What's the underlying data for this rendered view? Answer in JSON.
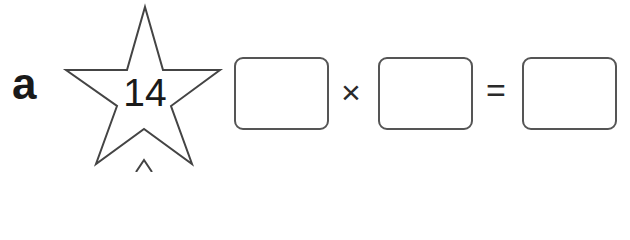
{
  "question": {
    "label": "a",
    "star_number": "14",
    "operators": {
      "multiply": "×",
      "equals": "="
    },
    "answer_boxes": [
      {
        "id": "factor1",
        "value": ""
      },
      {
        "id": "factor2",
        "value": ""
      },
      {
        "id": "product",
        "value": ""
      }
    ]
  },
  "colors": {
    "ink": "#1a1a1a",
    "box_border": "#555555",
    "background": "#ffffff"
  }
}
